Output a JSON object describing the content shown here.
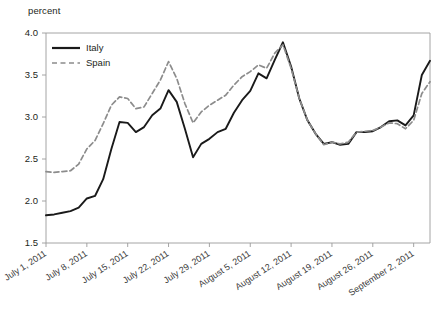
{
  "figure": {
    "axis_unit_label": "percent",
    "name": "line-chart-bond-yields"
  },
  "legend": {
    "position": "top-left-inside",
    "entries": [
      {
        "label": "Italy",
        "color": "#1a1a1a",
        "style": "solid"
      },
      {
        "label": "Spain",
        "color": "#8c8c8c",
        "style": "dashed"
      }
    ]
  },
  "chart_data": {
    "type": "line",
    "title": "",
    "xlabel": "",
    "ylabel": "percent",
    "ylim": [
      1.5,
      4.0
    ],
    "yticks": [
      "1.5",
      "2.0",
      "2.5",
      "3.0",
      "3.5",
      "4.0"
    ],
    "ytick_values": [
      1.5,
      2.0,
      2.5,
      3.0,
      3.5,
      4.0
    ],
    "grid": false,
    "legend_position": "top-left-inside",
    "xtick_labels": [
      "July 1, 2011",
      "July 8, 2011",
      "July 15, 2011",
      "July 22, 2011",
      "July 29, 2011",
      "August 5, 2011",
      "August 12, 2011",
      "August 19, 2011",
      "August 26, 2011",
      "September 2, 2011"
    ],
    "xtick_indices": [
      0,
      5,
      10,
      15,
      20,
      25,
      30,
      35,
      40,
      45
    ],
    "x_index_count": 48,
    "series": [
      {
        "name": "Italy",
        "color": "#1a1a1a",
        "style": "solid",
        "values": [
          1.83,
          1.84,
          1.86,
          1.88,
          1.92,
          2.03,
          2.06,
          2.26,
          2.62,
          2.94,
          2.93,
          2.82,
          2.88,
          3.02,
          3.1,
          3.32,
          3.18,
          2.86,
          2.52,
          2.68,
          2.74,
          2.82,
          2.86,
          3.05,
          3.2,
          3.31,
          3.52,
          3.46,
          3.68,
          3.89,
          3.6,
          3.22,
          2.96,
          2.8,
          2.68,
          2.7,
          2.67,
          2.68,
          2.82,
          2.82,
          2.83,
          2.88,
          2.95,
          2.96,
          2.9,
          3.02,
          3.5,
          3.67
        ]
      },
      {
        "name": "Spain",
        "color": "#8c8c8c",
        "style": "dashed",
        "values": [
          2.35,
          2.34,
          2.35,
          2.36,
          2.44,
          2.62,
          2.72,
          2.92,
          3.14,
          3.24,
          3.22,
          3.1,
          3.12,
          3.28,
          3.44,
          3.66,
          3.46,
          3.16,
          2.93,
          3.06,
          3.14,
          3.2,
          3.26,
          3.38,
          3.48,
          3.54,
          3.62,
          3.58,
          3.76,
          3.86,
          3.58,
          3.22,
          2.96,
          2.8,
          2.67,
          2.7,
          2.68,
          2.7,
          2.82,
          2.83,
          2.84,
          2.88,
          2.93,
          2.92,
          2.86,
          2.96,
          3.28,
          3.42
        ]
      }
    ]
  }
}
